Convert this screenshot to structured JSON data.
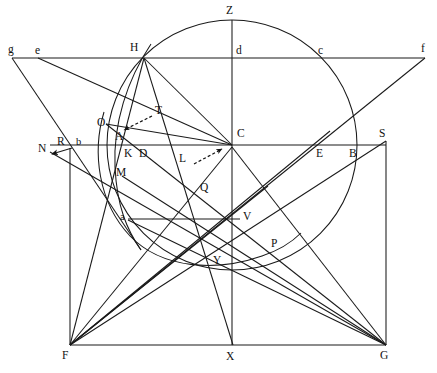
{
  "figure": {
    "type": "line-diagram",
    "width": 437,
    "height": 373,
    "background_color": "#ffffff",
    "ink_color": "#1a1a1a"
  },
  "points": [
    {
      "id": "g",
      "label": "g",
      "x": 12,
      "y": 58,
      "label_x": 8,
      "label_y": 44
    },
    {
      "id": "e",
      "label": "e",
      "x": 38,
      "y": 58,
      "label_x": 35,
      "label_y": 45
    },
    {
      "id": "H",
      "label": "H",
      "x": 144,
      "y": 58,
      "label_x": 131,
      "label_y": 43
    },
    {
      "id": "d",
      "label": "d",
      "x": 232,
      "y": 58,
      "label_x": 236,
      "label_y": 45
    },
    {
      "id": "c",
      "label": "c",
      "x": 320,
      "y": 58,
      "label_x": 318,
      "label_y": 45
    },
    {
      "id": "f",
      "label": "f",
      "x": 425,
      "y": 58,
      "label_x": 422,
      "label_y": 44
    },
    {
      "id": "Z",
      "label": "Z",
      "x": 232,
      "y": 20,
      "label_x": 227,
      "label_y": 6
    },
    {
      "id": "T",
      "label": "T",
      "x": 158,
      "y": 113,
      "label_x": 155,
      "label_y": 108
    },
    {
      "id": "O",
      "label": "O",
      "x": 108,
      "y": 126,
      "label_x": 98,
      "label_y": 118
    },
    {
      "id": "C",
      "label": "C",
      "x": 232,
      "y": 145,
      "label_x": 237,
      "label_y": 130
    },
    {
      "id": "S",
      "label": "S",
      "x": 386,
      "y": 141,
      "label_x": 381,
      "label_y": 130
    },
    {
      "id": "A",
      "label": "A",
      "x": 122,
      "y": 140,
      "label_x": 116,
      "label_y": 133
    },
    {
      "id": "N",
      "label": "N",
      "x": 46,
      "y": 153,
      "label_x": 40,
      "label_y": 144
    },
    {
      "id": "R",
      "label": "R",
      "x": 64,
      "y": 145,
      "label_x": 58,
      "label_y": 139
    },
    {
      "id": "b",
      "label": "b",
      "x": 80,
      "y": 145,
      "label_x": 76,
      "label_y": 140
    },
    {
      "id": "K",
      "label": "K",
      "x": 130,
      "y": 155,
      "label_x": 125,
      "label_y": 149
    },
    {
      "id": "D",
      "label": "D",
      "x": 144,
      "y": 155,
      "label_x": 140,
      "label_y": 149
    },
    {
      "id": "L",
      "label": "L",
      "x": 188,
      "y": 160,
      "label_x": 183,
      "label_y": 152
    },
    {
      "id": "E",
      "label": "E",
      "x": 322,
      "y": 155,
      "label_x": 317,
      "label_y": 149
    },
    {
      "id": "B",
      "label": "B",
      "x": 355,
      "y": 155,
      "label_x": 350,
      "label_y": 149
    },
    {
      "id": "M",
      "label": "M",
      "x": 124,
      "y": 178,
      "label_x": 118,
      "label_y": 168
    },
    {
      "id": "Q",
      "label": "Q",
      "x": 206,
      "y": 190,
      "label_x": 201,
      "label_y": 183
    },
    {
      "id": "a",
      "label": "a",
      "x": 128,
      "y": 220,
      "label_x": 121,
      "label_y": 212
    },
    {
      "id": "V",
      "label": "V",
      "x": 240,
      "y": 220,
      "label_x": 243,
      "label_y": 212
    },
    {
      "id": "P",
      "label": "P",
      "x": 277,
      "y": 247,
      "label_x": 272,
      "label_y": 239
    },
    {
      "id": "Y",
      "label": "Y",
      "x": 220,
      "y": 264,
      "label_x": 215,
      "label_y": 256
    },
    {
      "id": "F",
      "label": "F",
      "x": 70,
      "y": 345,
      "label_x": 63,
      "label_y": 350
    },
    {
      "id": "X",
      "label": "X",
      "x": 232,
      "y": 345,
      "label_x": 227,
      "label_y": 351
    },
    {
      "id": "G",
      "label": "G",
      "x": 386,
      "y": 345,
      "label_x": 381,
      "label_y": 350
    }
  ],
  "circles": [
    {
      "id": "main-circle",
      "cx": 232,
      "cy": 145,
      "r": 125
    },
    {
      "id": "small-arc",
      "cx": 232,
      "cy": 145,
      "r": 124,
      "note": "secondary arc through O M a Y P"
    }
  ],
  "arcs": [
    {
      "id": "arc-O-M-a-Y-P",
      "d": "M 104 112 C 92 150, 96 200, 128 235 C 160 268, 215 272, 262 256 C 281 249, 294 240, 302 232"
    },
    {
      "id": "arc-H-K-M-a",
      "d": "M 150 42 C 126 78, 112 122, 114 166 C 116 206, 126 228, 140 248"
    }
  ],
  "segments": [
    {
      "id": "top-horizontal-gf",
      "from": "g",
      "to": "f"
    },
    {
      "id": "mid-horizontal-NS",
      "from": "N",
      "to": "S"
    },
    {
      "id": "vertical-ZX",
      "from": "Z",
      "to": "X"
    },
    {
      "id": "rect-left-FN",
      "from": "F",
      "to": "N"
    },
    {
      "id": "rect-right-GS",
      "from": "G",
      "to": "S"
    },
    {
      "id": "rect-bottom-FG",
      "from": "F",
      "to": "G"
    },
    {
      "id": "seg-a-V",
      "from": "a",
      "to": "V"
    },
    {
      "id": "seg-g-to-lower",
      "from": "g",
      "to": "M"
    },
    {
      "id": "seg-e-to-C",
      "from": "e",
      "to": "C"
    },
    {
      "id": "seg-H-to-F",
      "from": "H",
      "to": "F"
    },
    {
      "id": "seg-H-to-C",
      "from": "H",
      "to": "C"
    },
    {
      "id": "seg-H-to-Y",
      "from": "H",
      "to": "Y"
    },
    {
      "id": "seg-O-to-C",
      "from": "O",
      "to": "C"
    },
    {
      "id": "seg-O-to-G",
      "from": "O",
      "to": "G"
    },
    {
      "id": "seg-C-to-F",
      "from": "C",
      "to": "F"
    },
    {
      "id": "seg-C-to-G",
      "from": "C",
      "to": "G"
    },
    {
      "id": "seg-C-to-X",
      "from": "C",
      "to": "X"
    },
    {
      "id": "seg-F-to-S",
      "from": "F",
      "to": "S"
    },
    {
      "id": "seg-F-to-f",
      "from": "F",
      "to": "f"
    },
    {
      "id": "seg-N-to-G",
      "from": "N",
      "to": "G"
    },
    {
      "id": "seg-M-to-G",
      "from": "M",
      "to": "G"
    },
    {
      "id": "seg-a-to-G",
      "from": "a",
      "to": "G"
    },
    {
      "id": "seg-F-to-P",
      "from": "F",
      "to": "P"
    },
    {
      "id": "seg-F-to-V",
      "from": "F",
      "to": "V"
    },
    {
      "id": "seg-F-to-Q",
      "from": "F",
      "to": "Q"
    }
  ],
  "annotations": [
    {
      "id": "pointer-T",
      "label": "T",
      "arrow_from": [
        152,
        116
      ],
      "arrow_to": [
        120,
        131
      ],
      "style": "dashed-arrow"
    },
    {
      "id": "pointer-L",
      "label": "L",
      "arrow_from": [
        193,
        163
      ],
      "arrow_to": [
        226,
        148
      ],
      "style": "dashed-arrow"
    },
    {
      "id": "pointer-N",
      "label": "N",
      "arrow_from": [
        70,
        148
      ],
      "arrow_to": [
        50,
        154
      ],
      "style": "solid-arrow"
    }
  ]
}
